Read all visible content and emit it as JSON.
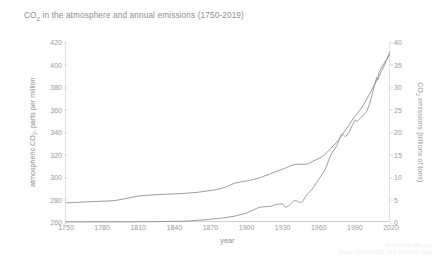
{
  "chart_data": {
    "type": "line",
    "title": "CO2 in the atmosphere and annual emissions (1750-2019)",
    "title_main": "in the atmosphere and annual emissions (1750-2019)",
    "title_prefix": "CO",
    "title_sub": "2",
    "xlabel": "year",
    "ylabel_left_prefix": "atmospheric CO",
    "ylabel_left_sub": "2",
    "ylabel_left_suffix": ", parts per million",
    "ylabel_right_prefix": "CO",
    "ylabel_right_sub": "2",
    "ylabel_right_suffix": " emissions (billions of tons)",
    "grid": false,
    "legend_position": "none",
    "xlim": [
      1750,
      2020
    ],
    "xticks": [
      1750,
      1780,
      1810,
      1840,
      1870,
      1900,
      1930,
      1960,
      1990,
      2020
    ],
    "xtick_labels": [
      "1750",
      "1780",
      "1810",
      "1840",
      "1870",
      "1900",
      "1930",
      "1960",
      "1990",
      "2020"
    ],
    "ylim_left": [
      260,
      420
    ],
    "yticks_left": [
      260,
      280,
      300,
      320,
      340,
      360,
      380,
      400,
      420
    ],
    "ytick_labels_left": [
      "260",
      "280",
      "300",
      "320",
      "340",
      "360",
      "380",
      "400",
      "420"
    ],
    "ylim_right": [
      0,
      40
    ],
    "yticks_right": [
      0,
      5,
      10,
      15,
      20,
      25,
      30,
      35,
      40
    ],
    "ytick_labels_right": [
      "0",
      "5",
      "10",
      "15",
      "20",
      "25",
      "30",
      "35",
      "40"
    ],
    "line_color": "#8a8a8a",
    "series": [
      {
        "name": "atmospheric CO2 concentration",
        "axis": "left",
        "units": "parts per million",
        "x": [
          1750,
          1760,
          1770,
          1780,
          1790,
          1800,
          1810,
          1820,
          1830,
          1840,
          1850,
          1860,
          1870,
          1880,
          1890,
          1900,
          1910,
          1920,
          1930,
          1940,
          1950,
          1955,
          1960,
          1965,
          1970,
          1975,
          1980,
          1985,
          1990,
          1995,
          2000,
          2005,
          2010,
          2015,
          2019
        ],
        "values": [
          277,
          277.5,
          278,
          278.5,
          279,
          281,
          283,
          284,
          284.5,
          285,
          285.5,
          286.5,
          288,
          290,
          294.5,
          296.5,
          299,
          303,
          307,
          311,
          311.5,
          314,
          316.5,
          320,
          325.5,
          331,
          338.5,
          346,
          354,
          360.5,
          369.5,
          379.5,
          389.5,
          400.5,
          411
        ]
      },
      {
        "name": "annual CO2 emissions",
        "axis": "right",
        "units": "billions of tons",
        "x": [
          1750,
          1800,
          1830,
          1850,
          1870,
          1880,
          1890,
          1900,
          1910,
          1915,
          1920,
          1925,
          1930,
          1932,
          1935,
          1940,
          1944,
          1946,
          1950,
          1955,
          1960,
          1965,
          1970,
          1975,
          1979,
          1982,
          1985,
          1990,
          1992,
          1995,
          2000,
          2003,
          2008,
          2009,
          2010,
          2015,
          2018,
          2019
        ],
        "values": [
          0.01,
          0.03,
          0.1,
          0.2,
          0.6,
          0.9,
          1.3,
          2.0,
          3.2,
          3.4,
          3.5,
          3.9,
          4.0,
          3.3,
          3.6,
          4.8,
          4.4,
          4.4,
          6.0,
          7.5,
          9.5,
          11.5,
          14.9,
          17.0,
          19.5,
          19.0,
          19.9,
          22.6,
          22.4,
          23.2,
          24.7,
          27.0,
          32.0,
          31.6,
          33.2,
          35.6,
          36.8,
          37.0
        ]
      }
    ],
    "annotations": [
      "NOAA Climate.gov"
    ],
    "credit_line_1": "NOAA Climate.gov",
    "credit_line_2": "Data: NOAA NCEI, Our World in Data"
  }
}
